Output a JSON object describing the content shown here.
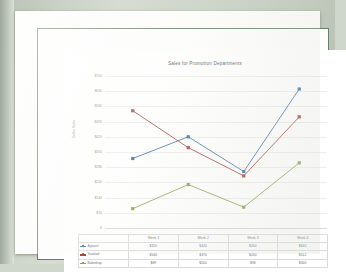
{
  "document": {
    "kind": "printed-page-photo",
    "page_background": "#fdfdfb",
    "frame_color": "#67806a"
  },
  "chart_data": {
    "type": "line",
    "title": "Sales for Promotion Departments",
    "xlabel": "",
    "ylabel": "Dollar Sales",
    "categories": [
      "Week 1",
      "Week 2",
      "Week 3",
      "Week 4"
    ],
    "series": [
      {
        "name": "Apparel",
        "color": "#4572a7",
        "values": [
          320,
          420,
          260,
          640
        ]
      },
      {
        "name": "Seafood",
        "color": "#aa4643",
        "values": [
          540,
          370,
          240,
          512
        ]
      },
      {
        "name": "Bakeshop",
        "color": "#89a54e",
        "values": [
          89,
          200,
          96,
          300
        ]
      }
    ],
    "ylim": [
      0,
      700
    ],
    "yticks": [
      0,
      70,
      140,
      210,
      280,
      350,
      420,
      490,
      560,
      630,
      700
    ],
    "ytick_labels": [
      "0",
      "$70",
      "$140",
      "$210",
      "$280",
      "$350",
      "$420",
      "$490",
      "$560",
      "$630",
      "$700"
    ],
    "grid": true,
    "legend_position": "data-table",
    "markers": true
  },
  "table": {
    "corner_label": "",
    "headers": [
      "Week 1",
      "Week 2",
      "Week 3",
      "Week 4"
    ],
    "rows": [
      {
        "label": "Apparel",
        "color": "#4572a7",
        "values": [
          "$320",
          "$420",
          "$260",
          "$640"
        ]
      },
      {
        "label": "Seafood",
        "color": "#aa4643",
        "values": [
          "$540",
          "$370",
          "$240",
          "$512"
        ]
      },
      {
        "label": "Bakeshop",
        "color": "#89a54e",
        "values": [
          "$89",
          "$200",
          "$96",
          "$300"
        ]
      }
    ]
  }
}
